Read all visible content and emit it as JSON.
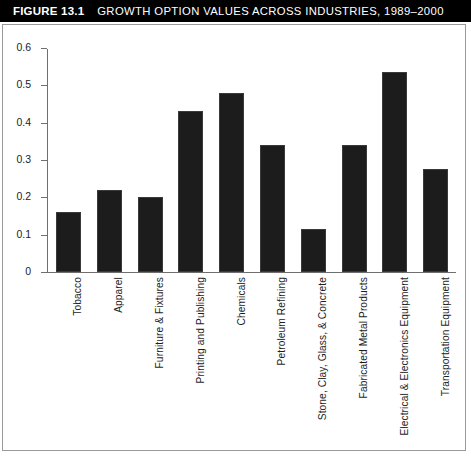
{
  "figure": {
    "number_label": "FIGURE 13.1",
    "title": "GROWTH OPTION VALUES ACROSS INDUSTRIES, 1989–2000",
    "title_bar_bg": "#000000",
    "title_bar_fg": "#ffffff",
    "frame_border_color": "#9a9a9a",
    "source_note": ""
  },
  "chart_data": {
    "type": "bar",
    "title": "GROWTH OPTION VALUES ACROSS INDUSTRIES, 1989–2000",
    "xlabel": "",
    "ylabel": "",
    "ylim": [
      0,
      0.6
    ],
    "grid": false,
    "legend": "none",
    "bar_color": "#1c1c1c",
    "axis_color": "#6f6f6f",
    "ytick_labels": [
      "0.6",
      "0.5",
      "0.4",
      "0.3",
      "0.2",
      "0.1",
      "0"
    ],
    "ytick_values": [
      0.6,
      0.5,
      0.4,
      0.3,
      0.2,
      0.1,
      0
    ],
    "categories": [
      "Tobacco",
      "Apparel",
      "Furniture & Fixtures",
      "Printing and Publishing",
      "Chemicals",
      "Petroleum Refining",
      "Stone, Clay, Glass, & Concrete",
      "Fabricated Metal Products",
      "Electrical & Electronics Equipment",
      "Transportation Equipment"
    ],
    "values": [
      0.16,
      0.22,
      0.2,
      0.43,
      0.48,
      0.34,
      0.115,
      0.34,
      0.535,
      0.275
    ]
  }
}
